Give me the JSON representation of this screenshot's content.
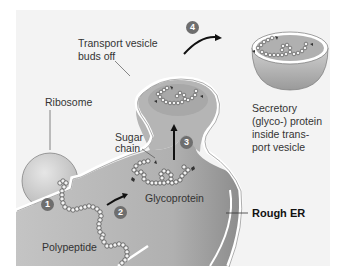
{
  "diagram": {
    "colors": {
      "background": "#f3f3f3",
      "er_lumen": "#b3b3b3",
      "membrane": "#ffffff",
      "outline": "#666666",
      "step_badge": "#6e6e6e",
      "ribosome": "#c8c8c8"
    },
    "labels": {
      "transport_vesicle_line1": "Transport vesicle",
      "transport_vesicle_line2": "buds off",
      "ribosome": "Ribosome",
      "sugar_line1": "Sugar",
      "sugar_line2": "chain",
      "glycoprotein": "Glycoprotein",
      "polypeptide": "Polypeptide",
      "rough_er": "Rough ER",
      "secretory_line1": "Secretory",
      "secretory_line2": "(glyco-) protein",
      "secretory_line3": "inside trans-",
      "secretory_line4": "port vesicle"
    },
    "steps": [
      "1",
      "2",
      "3",
      "4"
    ]
  }
}
